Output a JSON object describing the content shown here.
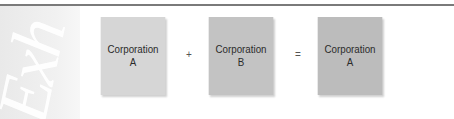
{
  "sidebar": {
    "decorative_text": "Exh"
  },
  "diagram": {
    "boxes": [
      {
        "line1": "Corporation",
        "line2": "A",
        "color": "#d6d6d6"
      },
      {
        "line1": "Corporation",
        "line2": "B",
        "color": "#c3c3c3"
      },
      {
        "line1": "Corporation",
        "line2": "A",
        "color": "#bcbcbc"
      }
    ],
    "operators": {
      "plus": "+",
      "equals": "="
    }
  }
}
